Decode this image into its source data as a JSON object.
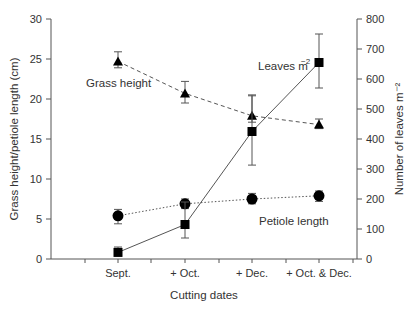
{
  "chart_data": {
    "type": "line",
    "title": "",
    "xlabel": "Cutting dates",
    "ylabel_left": "Grass height/petiole length (cm)",
    "ylabel_right": "Number of leaves m⁻²",
    "categories": [
      "Sept.",
      "+ Oct.",
      "+ Dec.",
      "+ Oct. & Dec."
    ],
    "ylim_left": [
      0,
      30
    ],
    "yticks_left": [
      0,
      5,
      10,
      15,
      20,
      25,
      30
    ],
    "ylim_right": [
      0,
      800
    ],
    "yticks_right": [
      0,
      100,
      200,
      300,
      400,
      500,
      600,
      700,
      800
    ],
    "grid": false,
    "series": [
      {
        "name": "Grass height",
        "axis": "left",
        "marker": "triangle",
        "line": "dashed",
        "values": [
          24.7,
          20.7,
          17.9,
          16.8
        ],
        "err_low": [
          23.9,
          19.5,
          17.1,
          16.3
        ],
        "err_high": [
          25.9,
          22.2,
          20.4,
          17.5
        ]
      },
      {
        "name": "Petiole length",
        "axis": "left",
        "marker": "circle",
        "line": "dotted",
        "values": [
          5.4,
          6.9,
          7.5,
          7.9
        ],
        "err_low": [
          4.4,
          6.3,
          6.9,
          7.2
        ],
        "err_high": [
          6.2,
          7.5,
          8.2,
          8.5
        ]
      },
      {
        "name": "Leaves m⁻²",
        "axis": "right",
        "marker": "square",
        "line": "solid",
        "values": [
          22,
          115,
          425,
          655
        ],
        "err_low": [
          10,
          70,
          313,
          570
        ],
        "err_high": [
          40,
          190,
          547,
          750
        ]
      }
    ],
    "annotations": [
      {
        "text": "Grass height",
        "near": "Sept."
      },
      {
        "text": "Leaves m⁻²",
        "near": "+ Oct. & Dec."
      },
      {
        "text": "Petiole length",
        "near": "+ Dec."
      }
    ]
  }
}
